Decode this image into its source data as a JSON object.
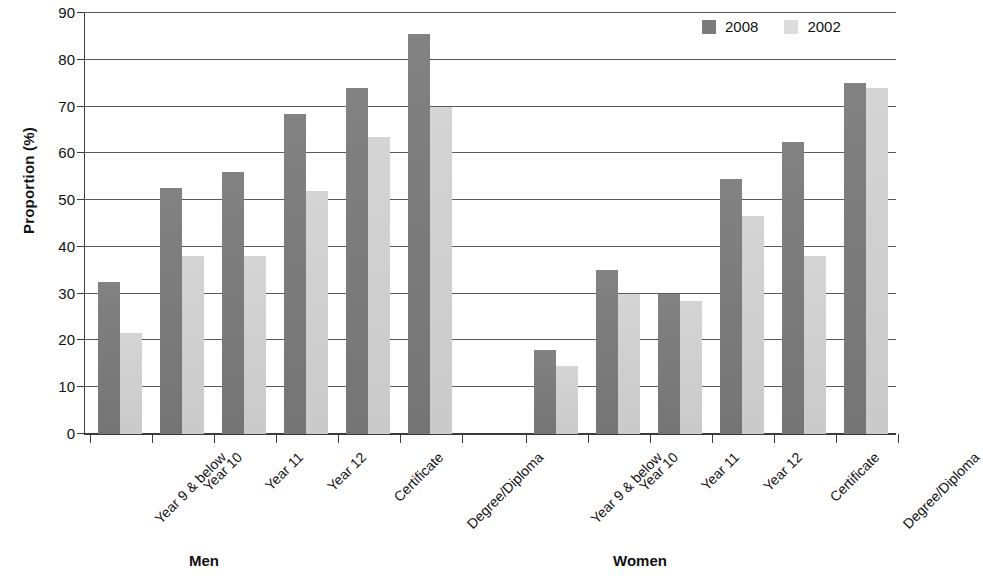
{
  "chart_data": {
    "type": "bar",
    "title": "",
    "xlabel": "",
    "ylabel": "Proportion (%)",
    "ylim": [
      0,
      90
    ],
    "yticks": [
      0,
      10,
      20,
      30,
      40,
      50,
      60,
      70,
      80,
      90
    ],
    "grid": true,
    "legend_position": "top-right",
    "legend": [
      "2008",
      "2002"
    ],
    "groups": [
      "Men",
      "Women"
    ],
    "categories": [
      "Year 9 & below",
      "Year 10",
      "Year 11",
      "Year 12",
      "Certificate",
      "Degree/Diploma"
    ],
    "series": [
      {
        "name": "2008",
        "color": "#7b7b7b",
        "values": {
          "Men": [
            32.5,
            52.5,
            56.0,
            68.5,
            74.0,
            85.5
          ],
          "Women": [
            18.0,
            35.0,
            30.0,
            54.5,
            62.5,
            75.0
          ]
        }
      },
      {
        "name": "2002",
        "color": "#d2d2d2",
        "values": {
          "Men": [
            21.5,
            38.0,
            38.0,
            52.0,
            63.5,
            70.0
          ],
          "Women": [
            14.5,
            30.0,
            28.5,
            46.5,
            38.0,
            74.0
          ]
        }
      }
    ]
  },
  "axis": {
    "y_title": "Proportion (%)",
    "tick_labels": [
      "0",
      "10",
      "20",
      "30",
      "40",
      "50",
      "60",
      "70",
      "80",
      "90"
    ]
  },
  "legend": {
    "items": [
      {
        "label": "2008",
        "color": "#7b7b7b"
      },
      {
        "label": "2002",
        "color": "#dcdcdc"
      }
    ]
  },
  "groups": [
    {
      "label": "Men"
    },
    {
      "label": "Women"
    }
  ],
  "categories": [
    "Year 9 & below",
    "Year 10",
    "Year 11",
    "Year 12",
    "Certificate",
    "Degree/Diploma"
  ]
}
